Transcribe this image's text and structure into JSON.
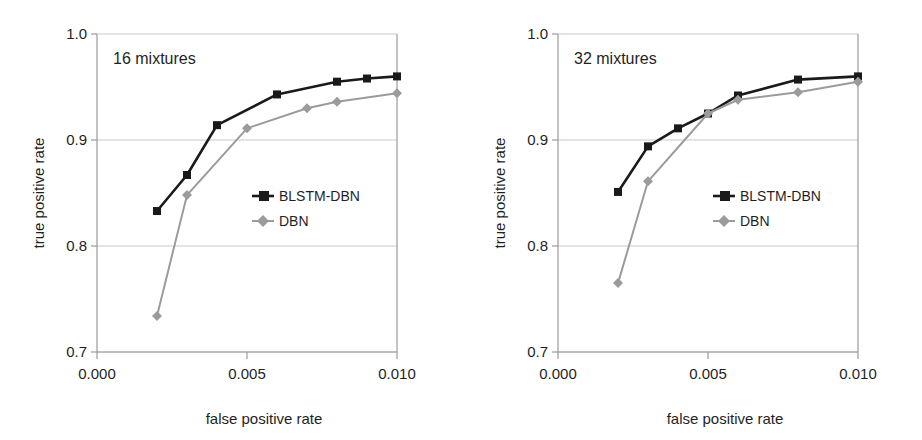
{
  "figure": {
    "panels": [
      {
        "id": "left",
        "title": "16 mixtures",
        "xlabel": "false positive rate",
        "ylabel": "true positive rate",
        "xticks": [
          "0.000",
          "0.005",
          "0.010"
        ],
        "yticks": [
          "0.7",
          "0.8",
          "0.9",
          "1.0"
        ],
        "legend": [
          {
            "label": "BLSTM-DBN",
            "marker": "square-marker-icon",
            "color": "#1a1a1a"
          },
          {
            "label": "DBN",
            "marker": "diamond-marker-icon",
            "color": "#9b9b9b"
          }
        ]
      },
      {
        "id": "right",
        "title": "32 mixtures",
        "xlabel": "false positive rate",
        "ylabel": "true positive rate",
        "xticks": [
          "0.000",
          "0.005",
          "0.010"
        ],
        "yticks": [
          "0.7",
          "0.8",
          "0.9",
          "1.0"
        ],
        "legend": [
          {
            "label": "BLSTM-DBN",
            "marker": "square-marker-icon",
            "color": "#1a1a1a"
          },
          {
            "label": "DBN",
            "marker": "diamond-marker-icon",
            "color": "#9b9b9b"
          }
        ]
      }
    ]
  },
  "chart_data": [
    {
      "type": "line",
      "title": "16 mixtures",
      "xlabel": "false positive rate",
      "ylabel": "true positive rate",
      "xlim": [
        0.0,
        0.01
      ],
      "ylim": [
        0.7,
        1.0
      ],
      "xticks": [
        0.0,
        0.005,
        0.01
      ],
      "yticks": [
        0.7,
        0.8,
        0.9,
        1.0
      ],
      "grid": true,
      "legend_position": "center-right",
      "series": [
        {
          "name": "BLSTM-DBN",
          "color": "#1a1a1a",
          "marker": "square",
          "x": [
            0.002,
            0.003,
            0.004,
            0.006,
            0.008,
            0.009,
            0.01
          ],
          "y": [
            0.833,
            0.867,
            0.914,
            0.943,
            0.955,
            0.958,
            0.96
          ]
        },
        {
          "name": "DBN",
          "color": "#9b9b9b",
          "marker": "diamond",
          "x": [
            0.002,
            0.003,
            0.005,
            0.007,
            0.008,
            0.01
          ],
          "y": [
            0.734,
            0.848,
            0.911,
            0.93,
            0.936,
            0.944
          ]
        }
      ]
    },
    {
      "type": "line",
      "title": "32 mixtures",
      "xlabel": "false positive rate",
      "ylabel": "true positive rate",
      "xlim": [
        0.0,
        0.01
      ],
      "ylim": [
        0.7,
        1.0
      ],
      "xticks": [
        0.0,
        0.005,
        0.01
      ],
      "yticks": [
        0.7,
        0.8,
        0.9,
        1.0
      ],
      "grid": true,
      "legend_position": "center-right",
      "series": [
        {
          "name": "BLSTM-DBN",
          "color": "#1a1a1a",
          "marker": "square",
          "x": [
            0.002,
            0.003,
            0.004,
            0.005,
            0.006,
            0.008,
            0.01
          ],
          "y": [
            0.851,
            0.894,
            0.911,
            0.925,
            0.942,
            0.957,
            0.96
          ]
        },
        {
          "name": "DBN",
          "color": "#9b9b9b",
          "marker": "diamond",
          "x": [
            0.002,
            0.003,
            0.005,
            0.006,
            0.008,
            0.01
          ],
          "y": [
            0.765,
            0.861,
            0.925,
            0.938,
            0.945,
            0.955
          ]
        }
      ]
    }
  ]
}
